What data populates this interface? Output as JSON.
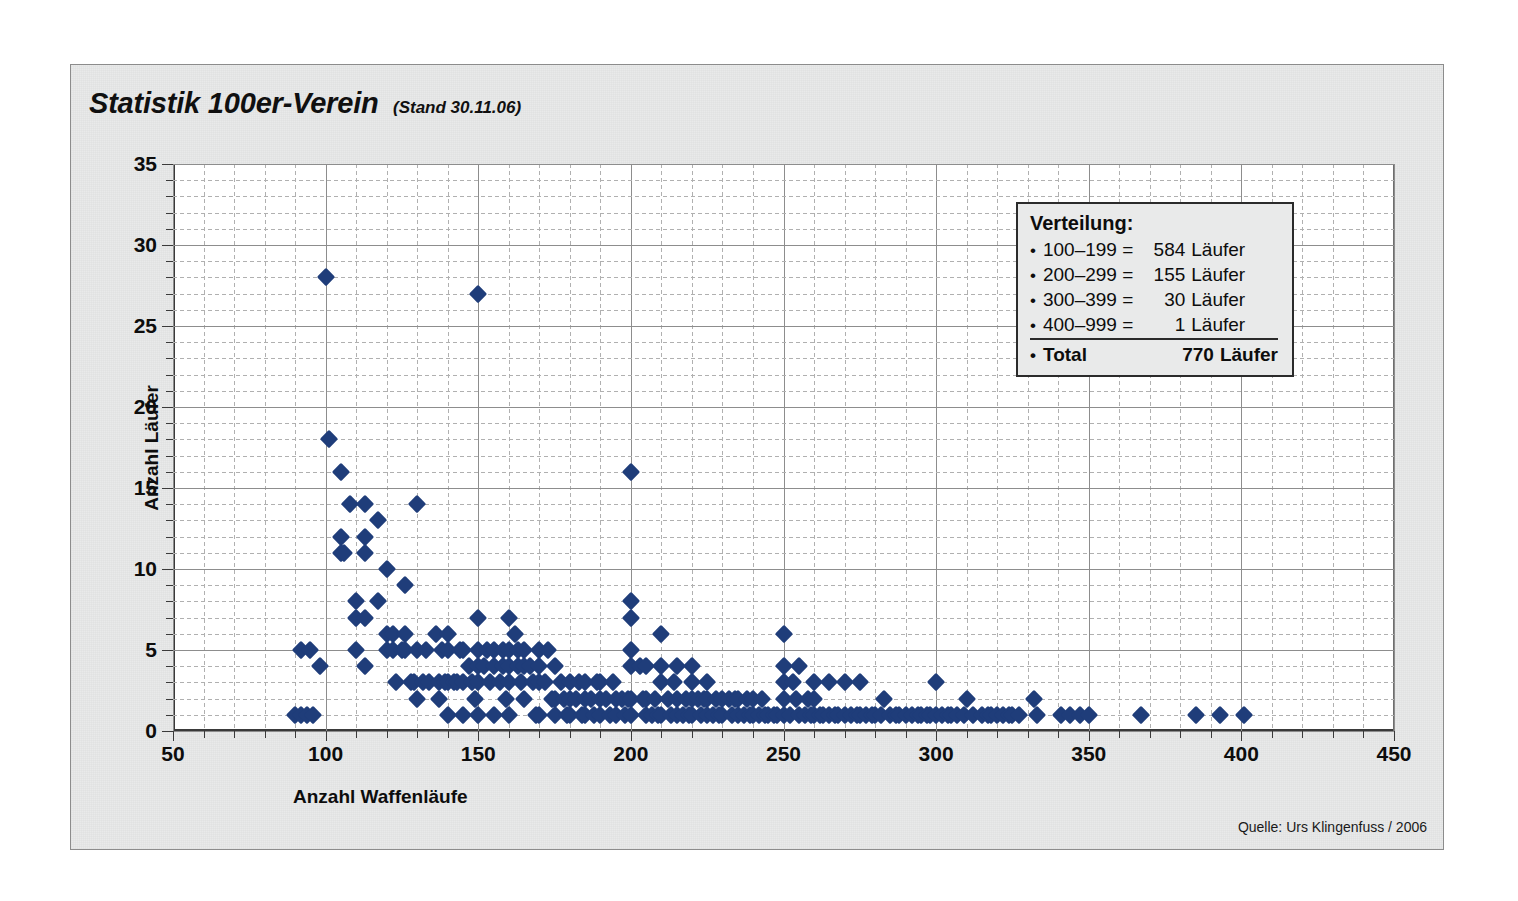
{
  "header": {
    "title": "Statistik 100er-Verein",
    "subtitle": "(Stand 30.11.06)"
  },
  "source": "Quelle: Urs Klingenfuss / 2006",
  "legend": {
    "title": "Verteilung:",
    "bullet": "•",
    "rows": [
      {
        "range": "100–199 =",
        "count": "584",
        "unit": "Läufer"
      },
      {
        "range": "200–299 =",
        "count": "155",
        "unit": "Läufer"
      },
      {
        "range": "300–399 =",
        "count": "30",
        "unit": "Läufer"
      },
      {
        "range": "400–999 =",
        "count": "1",
        "unit": "Läufer"
      }
    ],
    "total": {
      "label": "Total",
      "count": "770",
      "unit": "Läufer"
    }
  },
  "colors": {
    "marker": "#1f3d7a",
    "frame_background": "#e9eaea",
    "plot_background": "#ffffff",
    "gridline_major": "#8d8d8d",
    "gridline_minor": "#b0b0b0",
    "axis": "#3a3a3a",
    "text": "#0d0d0d"
  },
  "chart_data": {
    "type": "scatter",
    "title": "Statistik 100er-Verein",
    "subtitle": "(Stand 30.11.06)",
    "xlabel": "Anzahl Waffenläufe",
    "ylabel": "Anzahl Läufer",
    "xlim": [
      50,
      450
    ],
    "ylim": [
      0,
      35
    ],
    "xticks": [
      50,
      100,
      150,
      200,
      250,
      300,
      350,
      400,
      450
    ],
    "yticks": [
      0,
      5,
      10,
      15,
      20,
      25,
      30,
      35
    ],
    "x_minor_step": 10,
    "y_minor_step": 1,
    "grid": true,
    "legend_position": "upper-right",
    "marker": "diamond",
    "marker_color": "#1f3d7a",
    "series_name": "Läufer pro Waffenlauf-Anzahl",
    "points": [
      [
        90,
        1
      ],
      [
        92,
        1
      ],
      [
        94,
        1
      ],
      [
        96,
        1
      ],
      [
        92,
        5
      ],
      [
        95,
        5
      ],
      [
        98,
        4
      ],
      [
        100,
        28
      ],
      [
        101,
        18
      ],
      [
        105,
        16
      ],
      [
        105,
        12
      ],
      [
        105,
        11
      ],
      [
        106,
        11
      ],
      [
        108,
        14
      ],
      [
        110,
        8
      ],
      [
        110,
        7
      ],
      [
        110,
        5
      ],
      [
        113,
        14
      ],
      [
        113,
        12
      ],
      [
        113,
        11
      ],
      [
        113,
        7
      ],
      [
        113,
        4
      ],
      [
        117,
        13
      ],
      [
        117,
        8
      ],
      [
        120,
        10
      ],
      [
        120,
        6
      ],
      [
        120,
        5
      ],
      [
        122,
        6
      ],
      [
        122,
        5
      ],
      [
        123,
        3
      ],
      [
        125,
        5
      ],
      [
        126,
        9
      ],
      [
        126,
        6
      ],
      [
        126,
        5
      ],
      [
        128,
        3
      ],
      [
        129,
        3
      ],
      [
        130,
        14
      ],
      [
        130,
        5
      ],
      [
        130,
        2
      ],
      [
        132,
        3
      ],
      [
        133,
        5
      ],
      [
        134,
        3
      ],
      [
        136,
        6
      ],
      [
        137,
        3
      ],
      [
        137,
        2
      ],
      [
        138,
        5
      ],
      [
        139,
        3
      ],
      [
        140,
        6
      ],
      [
        140,
        5
      ],
      [
        140,
        3
      ],
      [
        140,
        1
      ],
      [
        142,
        3
      ],
      [
        143,
        3
      ],
      [
        144,
        5
      ],
      [
        145,
        5
      ],
      [
        145,
        3
      ],
      [
        145,
        1
      ],
      [
        147,
        4
      ],
      [
        148,
        3
      ],
      [
        149,
        2
      ],
      [
        150,
        27
      ],
      [
        150,
        7
      ],
      [
        150,
        5
      ],
      [
        150,
        4
      ],
      [
        150,
        3
      ],
      [
        150,
        1
      ],
      [
        152,
        4
      ],
      [
        153,
        5
      ],
      [
        154,
        3
      ],
      [
        155,
        5
      ],
      [
        155,
        4
      ],
      [
        155,
        1
      ],
      [
        157,
        3
      ],
      [
        158,
        5
      ],
      [
        158,
        4
      ],
      [
        159,
        2
      ],
      [
        160,
        7
      ],
      [
        160,
        5
      ],
      [
        160,
        4
      ],
      [
        160,
        3
      ],
      [
        160,
        1
      ],
      [
        162,
        6
      ],
      [
        163,
        5
      ],
      [
        163,
        4
      ],
      [
        164,
        3
      ],
      [
        165,
        5
      ],
      [
        165,
        4
      ],
      [
        165,
        2
      ],
      [
        167,
        4
      ],
      [
        168,
        3
      ],
      [
        169,
        1
      ],
      [
        170,
        5
      ],
      [
        170,
        4
      ],
      [
        170,
        3
      ],
      [
        170,
        1
      ],
      [
        172,
        3
      ],
      [
        173,
        5
      ],
      [
        174,
        2
      ],
      [
        175,
        4
      ],
      [
        175,
        2
      ],
      [
        175,
        1
      ],
      [
        177,
        3
      ],
      [
        178,
        2
      ],
      [
        179,
        1
      ],
      [
        180,
        3
      ],
      [
        180,
        2
      ],
      [
        180,
        1
      ],
      [
        182,
        2
      ],
      [
        183,
        3
      ],
      [
        184,
        1
      ],
      [
        185,
        3
      ],
      [
        185,
        2
      ],
      [
        185,
        1
      ],
      [
        187,
        2
      ],
      [
        188,
        1
      ],
      [
        189,
        3
      ],
      [
        190,
        3
      ],
      [
        190,
        2
      ],
      [
        190,
        1
      ],
      [
        192,
        2
      ],
      [
        193,
        1
      ],
      [
        194,
        3
      ],
      [
        195,
        2
      ],
      [
        195,
        1
      ],
      [
        197,
        2
      ],
      [
        198,
        1
      ],
      [
        199,
        2
      ],
      [
        200,
        16
      ],
      [
        200,
        8
      ],
      [
        200,
        7
      ],
      [
        200,
        5
      ],
      [
        200,
        4
      ],
      [
        200,
        2
      ],
      [
        200,
        1
      ],
      [
        203,
        4
      ],
      [
        204,
        2
      ],
      [
        205,
        4
      ],
      [
        205,
        2
      ],
      [
        205,
        1
      ],
      [
        207,
        1
      ],
      [
        208,
        2
      ],
      [
        209,
        1
      ],
      [
        210,
        6
      ],
      [
        210,
        4
      ],
      [
        210,
        3
      ],
      [
        210,
        1
      ],
      [
        212,
        2
      ],
      [
        213,
        1
      ],
      [
        214,
        3
      ],
      [
        215,
        4
      ],
      [
        215,
        2
      ],
      [
        215,
        1
      ],
      [
        217,
        1
      ],
      [
        218,
        2
      ],
      [
        219,
        1
      ],
      [
        220,
        4
      ],
      [
        220,
        3
      ],
      [
        220,
        2
      ],
      [
        220,
        1
      ],
      [
        222,
        2
      ],
      [
        223,
        1
      ],
      [
        224,
        2
      ],
      [
        225,
        3
      ],
      [
        225,
        2
      ],
      [
        225,
        1
      ],
      [
        227,
        1
      ],
      [
        228,
        2
      ],
      [
        229,
        1
      ],
      [
        230,
        2
      ],
      [
        230,
        1
      ],
      [
        232,
        2
      ],
      [
        233,
        1
      ],
      [
        234,
        2
      ],
      [
        235,
        2
      ],
      [
        235,
        1
      ],
      [
        237,
        1
      ],
      [
        238,
        2
      ],
      [
        239,
        1
      ],
      [
        240,
        2
      ],
      [
        240,
        1
      ],
      [
        242,
        1
      ],
      [
        243,
        2
      ],
      [
        244,
        1
      ],
      [
        245,
        1
      ],
      [
        247,
        1
      ],
      [
        248,
        1
      ],
      [
        250,
        6
      ],
      [
        250,
        4
      ],
      [
        250,
        3
      ],
      [
        250,
        2
      ],
      [
        250,
        1
      ],
      [
        252,
        1
      ],
      [
        253,
        3
      ],
      [
        254,
        2
      ],
      [
        255,
        4
      ],
      [
        255,
        1
      ],
      [
        257,
        1
      ],
      [
        258,
        2
      ],
      [
        259,
        1
      ],
      [
        260,
        3
      ],
      [
        260,
        2
      ],
      [
        260,
        1
      ],
      [
        262,
        1
      ],
      [
        263,
        1
      ],
      [
        265,
        3
      ],
      [
        265,
        1
      ],
      [
        267,
        1
      ],
      [
        268,
        1
      ],
      [
        270,
        3
      ],
      [
        270,
        1
      ],
      [
        272,
        1
      ],
      [
        274,
        1
      ],
      [
        275,
        3
      ],
      [
        275,
        1
      ],
      [
        277,
        1
      ],
      [
        279,
        1
      ],
      [
        280,
        1
      ],
      [
        282,
        1
      ],
      [
        283,
        2
      ],
      [
        285,
        1
      ],
      [
        287,
        1
      ],
      [
        288,
        1
      ],
      [
        290,
        1
      ],
      [
        292,
        1
      ],
      [
        294,
        1
      ],
      [
        295,
        1
      ],
      [
        297,
        1
      ],
      [
        298,
        1
      ],
      [
        300,
        3
      ],
      [
        300,
        1
      ],
      [
        302,
        1
      ],
      [
        304,
        1
      ],
      [
        305,
        1
      ],
      [
        307,
        1
      ],
      [
        309,
        1
      ],
      [
        310,
        2
      ],
      [
        312,
        1
      ],
      [
        315,
        1
      ],
      [
        317,
        1
      ],
      [
        318,
        1
      ],
      [
        320,
        1
      ],
      [
        322,
        1
      ],
      [
        324,
        1
      ],
      [
        325,
        1
      ],
      [
        327,
        1
      ],
      [
        332,
        2
      ],
      [
        333,
        1
      ],
      [
        341,
        1
      ],
      [
        344,
        1
      ],
      [
        347,
        1
      ],
      [
        350,
        1
      ],
      [
        367,
        1
      ],
      [
        385,
        1
      ],
      [
        393,
        1
      ],
      [
        401,
        1
      ]
    ]
  }
}
